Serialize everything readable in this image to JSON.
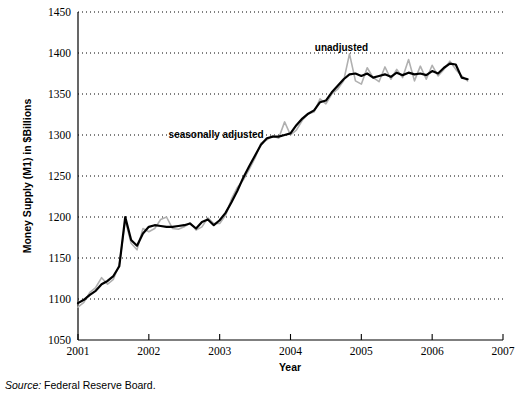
{
  "figure": {
    "source_label": "Source:",
    "source_text": "Federal Reserve Board."
  },
  "chart_data": {
    "type": "line",
    "title": "",
    "xlabel": "Year",
    "ylabel": "Money Supply (M1) in $Billions",
    "xlim": [
      2001,
      2007
    ],
    "ylim": [
      1050,
      1450
    ],
    "xticks": [
      "2001",
      "2002",
      "2003",
      "2004",
      "2005",
      "2006",
      "2007"
    ],
    "yticks": [
      "1050",
      "1100",
      "1150",
      "1200",
      "1250",
      "1300",
      "1350",
      "1400",
      "1450"
    ],
    "grid": "horizontal-dotted",
    "legend_position": "inline-annotations",
    "annotations": [
      {
        "text": "seasonally adjusted",
        "x": 2002.95,
        "y": 1296,
        "series": "seasonally adjusted"
      },
      {
        "text": "unadjusted",
        "x": 2004.72,
        "y": 1402,
        "series": "unadjusted"
      }
    ],
    "colors": {
      "seasonally_adjusted": "#000000",
      "unadjusted": "#b0b0b0"
    },
    "series": [
      {
        "name": "seasonally adjusted",
        "color": "#000000",
        "x": [
          2001.0,
          2001.083,
          2001.167,
          2001.25,
          2001.333,
          2001.417,
          2001.5,
          2001.583,
          2001.667,
          2001.75,
          2001.833,
          2001.917,
          2002.0,
          2002.083,
          2002.167,
          2002.25,
          2002.333,
          2002.417,
          2002.5,
          2002.583,
          2002.667,
          2002.75,
          2002.833,
          2002.917,
          2003.0,
          2003.083,
          2003.167,
          2003.25,
          2003.333,
          2003.417,
          2003.5,
          2003.583,
          2003.667,
          2003.75,
          2003.833,
          2003.917,
          2004.0,
          2004.083,
          2004.167,
          2004.25,
          2004.333,
          2004.417,
          2004.5,
          2004.583,
          2004.667,
          2004.75,
          2004.833,
          2004.917,
          2005.0,
          2005.083,
          2005.167,
          2005.25,
          2005.333,
          2005.417,
          2005.5,
          2005.583,
          2005.667,
          2005.75,
          2005.833,
          2005.917,
          2006.0,
          2006.083,
          2006.167,
          2006.25,
          2006.333,
          2006.417,
          2006.5
        ],
        "values": [
          1095,
          1099,
          1105,
          1110,
          1118,
          1122,
          1128,
          1140,
          1200,
          1172,
          1165,
          1180,
          1188,
          1190,
          1189,
          1188,
          1188,
          1189,
          1190,
          1192,
          1186,
          1194,
          1197,
          1190,
          1196,
          1205,
          1218,
          1232,
          1248,
          1262,
          1275,
          1288,
          1296,
          1298,
          1298,
          1300,
          1302,
          1312,
          1320,
          1326,
          1330,
          1340,
          1342,
          1352,
          1360,
          1368,
          1374,
          1375,
          1372,
          1375,
          1370,
          1372,
          1374,
          1371,
          1376,
          1373,
          1376,
          1374,
          1375,
          1373,
          1378,
          1375,
          1382,
          1387,
          1386,
          1370,
          1368
        ]
      },
      {
        "name": "unadjusted",
        "color": "#b0b0b0",
        "x": [
          2001.0,
          2001.083,
          2001.167,
          2001.25,
          2001.333,
          2001.417,
          2001.5,
          2001.583,
          2001.667,
          2001.75,
          2001.833,
          2001.917,
          2002.0,
          2002.083,
          2002.167,
          2002.25,
          2002.333,
          2002.417,
          2002.5,
          2002.583,
          2002.667,
          2002.75,
          2002.833,
          2002.917,
          2003.0,
          2003.083,
          2003.167,
          2003.25,
          2003.333,
          2003.417,
          2003.5,
          2003.583,
          2003.667,
          2003.75,
          2003.833,
          2003.917,
          2004.0,
          2004.083,
          2004.167,
          2004.25,
          2004.333,
          2004.417,
          2004.5,
          2004.583,
          2004.667,
          2004.75,
          2004.833,
          2004.917,
          2005.0,
          2005.083,
          2005.167,
          2005.25,
          2005.333,
          2005.417,
          2005.5,
          2005.583,
          2005.667,
          2005.75,
          2005.833,
          2005.917,
          2006.0,
          2006.083,
          2006.167,
          2006.25,
          2006.333,
          2006.417,
          2006.5
        ],
        "values": [
          1090,
          1096,
          1108,
          1114,
          1126,
          1118,
          1124,
          1142,
          1196,
          1168,
          1160,
          1186,
          1182,
          1186,
          1197,
          1200,
          1186,
          1185,
          1188,
          1193,
          1184,
          1188,
          1199,
          1192,
          1192,
          1202,
          1222,
          1236,
          1245,
          1258,
          1272,
          1290,
          1294,
          1299,
          1296,
          1316,
          1300,
          1306,
          1318,
          1326,
          1328,
          1344,
          1338,
          1350,
          1356,
          1366,
          1399,
          1366,
          1362,
          1382,
          1370,
          1365,
          1383,
          1368,
          1380,
          1370,
          1392,
          1366,
          1384,
          1368,
          1385,
          1372,
          1380,
          1390,
          1380,
          1372,
          1366
        ]
      }
    ]
  }
}
